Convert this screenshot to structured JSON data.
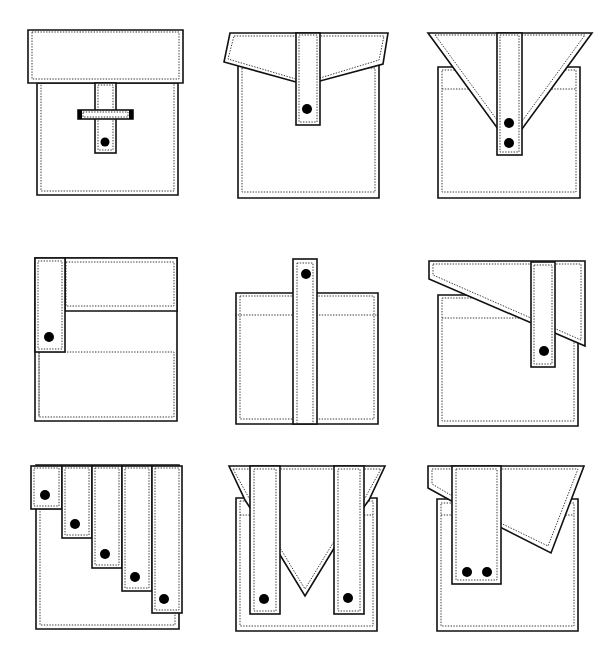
{
  "stroke_color": "#111111",
  "button_color": "#000000",
  "background": "#ffffff",
  "pockets": [
    {
      "name": "pocket-1-rect-flap-buckle",
      "body": [
        [
          37,
          83
        ],
        [
          178,
          83
        ],
        [
          178,
          195
        ],
        [
          37,
          195
        ]
      ],
      "body_stitch": [
        [
          41,
          83
        ],
        [
          174,
          83
        ],
        [
          174,
          191
        ],
        [
          41,
          191
        ]
      ],
      "flap": [
        [
          28,
          30
        ],
        [
          183,
          30
        ],
        [
          183,
          83
        ],
        [
          28,
          83
        ]
      ],
      "flap_stitch": [
        [
          32,
          32
        ],
        [
          179,
          32
        ],
        [
          179,
          79
        ],
        [
          32,
          79
        ]
      ],
      "straps": [
        {
          "rect": [
            95,
            83,
            21,
            70
          ],
          "stitch": [
            98,
            85,
            15,
            65
          ]
        }
      ],
      "buckle": {
        "rect": [
          78,
          110,
          55,
          9
        ],
        "stitch": [
          83,
          112,
          45,
          5
        ]
      },
      "buttons": [
        [
          105,
          142,
          4.5
        ]
      ],
      "extra_stitch_lines": []
    },
    {
      "name": "pocket-2-angled-flap-tab",
      "body": [
        [
          238,
          65
        ],
        [
          379,
          65
        ],
        [
          379,
          198
        ],
        [
          238,
          198
        ]
      ],
      "body_stitch": [
        [
          242,
          68
        ],
        [
          375,
          68
        ],
        [
          375,
          192
        ],
        [
          242,
          192
        ]
      ],
      "flap": [
        [
          230,
          33
        ],
        [
          388,
          33
        ],
        [
          383,
          64
        ],
        [
          320,
          81
        ],
        [
          296,
          82
        ],
        [
          224,
          62
        ]
      ],
      "flap_stitch": [
        [
          234,
          36
        ],
        [
          384,
          36
        ],
        [
          379,
          60
        ],
        [
          320,
          78
        ],
        [
          296,
          79
        ],
        [
          228,
          59
        ]
      ],
      "straps": [
        {
          "rect": [
            296,
            33,
            24,
            92
          ],
          "stitch": [
            299,
            35,
            18,
            87
          ]
        }
      ],
      "buttons": [
        [
          307,
          109,
          5
        ]
      ],
      "extra_stitch_lines": []
    },
    {
      "name": "pocket-3-v-flap-double-button",
      "body": [
        [
          438,
          67
        ],
        [
          580,
          67
        ],
        [
          580,
          198
        ],
        [
          438,
          198
        ]
      ],
      "body_stitch": [
        [
          442,
          70
        ],
        [
          576,
          70
        ],
        [
          576,
          192
        ],
        [
          442,
          192
        ]
      ],
      "flap": [
        [
          428,
          33
        ],
        [
          592,
          33
        ],
        [
          522,
          129
        ],
        [
          498,
          129
        ]
      ],
      "flap_stitch": [
        [
          435,
          35
        ],
        [
          585,
          35
        ],
        [
          520,
          124
        ],
        [
          500,
          124
        ]
      ],
      "straps": [
        {
          "rect": [
            497,
            33,
            25,
            122
          ],
          "stitch": [
            500,
            35,
            19,
            117
          ]
        }
      ],
      "buttons": [
        [
          509,
          123,
          5
        ],
        [
          509,
          143,
          5
        ]
      ],
      "extra_stitch_lines": [
        [
          [
            442,
            89
          ],
          [
            474,
            89
          ]
        ],
        [
          [
            546,
            89
          ],
          [
            576,
            89
          ]
        ]
      ]
    },
    {
      "name": "pocket-4-side-tab-upper-panel",
      "body": [
        [
          35,
          258
        ],
        [
          177,
          258
        ],
        [
          177,
          421
        ],
        [
          35,
          421
        ]
      ],
      "body_stitch": [
        [
          39,
          352
        ],
        [
          174,
          352
        ],
        [
          174,
          417
        ],
        [
          39,
          417
        ]
      ],
      "flap": [
        [
          65,
          258
        ],
        [
          177,
          258
        ],
        [
          177,
          311
        ],
        [
          65,
          311
        ]
      ],
      "flap_stitch": [
        [
          66,
          262
        ],
        [
          174,
          262
        ],
        [
          174,
          306
        ],
        [
          66,
          306
        ]
      ],
      "straps": [
        {
          "rect": [
            35,
            258,
            30,
            94
          ],
          "stitch": [
            38,
            261,
            24,
            88
          ]
        }
      ],
      "buttons": [
        [
          49,
          337,
          5
        ]
      ],
      "extra_stitch_lines": [
        [
          [
            39,
            352
          ],
          [
            39,
            417
          ]
        ]
      ]
    },
    {
      "name": "pocket-5-long-center-strap",
      "body": [
        [
          236,
          293
        ],
        [
          378,
          293
        ],
        [
          378,
          424
        ],
        [
          236,
          424
        ]
      ],
      "body_stitch": [
        [
          240,
          296
        ],
        [
          374,
          296
        ],
        [
          374,
          419
        ],
        [
          240,
          419
        ]
      ],
      "flap": null,
      "flap_stitch": null,
      "straps": [
        {
          "rect": [
            293,
            259,
            24,
            165
          ],
          "stitch": [
            297,
            263,
            16,
            161
          ]
        }
      ],
      "buttons": [
        [
          306,
          274,
          5
        ]
      ],
      "extra_stitch_lines": [
        [
          [
            235,
            315
          ],
          [
            378,
            315
          ]
        ]
      ]
    },
    {
      "name": "pocket-6-asymmetric-slant-flap",
      "body": [
        [
          438,
          295
        ],
        [
          578,
          295
        ],
        [
          578,
          426
        ],
        [
          438,
          426
        ]
      ],
      "body_stitch": [
        [
          442,
          298
        ],
        [
          574,
          298
        ],
        [
          574,
          421
        ],
        [
          442,
          421
        ]
      ],
      "flap": [
        [
          429,
          261
        ],
        [
          585,
          261
        ],
        [
          585,
          346
        ],
        [
          429,
          279
        ]
      ],
      "flap_stitch": [
        [
          433,
          264
        ],
        [
          581,
          264
        ],
        [
          581,
          340
        ],
        [
          433,
          275
        ]
      ],
      "straps": [
        {
          "rect": [
            531,
            262,
            24,
            105
          ],
          "stitch": [
            534,
            265,
            18,
            99
          ]
        }
      ],
      "buttons": [
        [
          544,
          351,
          5
        ]
      ],
      "extra_stitch_lines": [
        [
          [
            442,
            318
          ],
          [
            531,
            318
          ]
        ]
      ]
    },
    {
      "name": "pocket-7-stepped-five-tabs",
      "body": [
        [
          36,
          465
        ],
        [
          179,
          465
        ],
        [
          179,
          629
        ],
        [
          36,
          629
        ]
      ],
      "body_stitch": [
        [
          40,
          509
        ],
        [
          175,
          509
        ],
        [
          175,
          625
        ],
        [
          40,
          625
        ]
      ],
      "flap": null,
      "flap_stitch": null,
      "straps": [
        {
          "rect": [
            31,
            466,
            31,
            43
          ],
          "stitch": [
            34,
            468,
            25,
            38
          ]
        },
        {
          "rect": [
            62,
            466,
            30,
            72
          ],
          "stitch": [
            65,
            468,
            24,
            67
          ]
        },
        {
          "rect": [
            92,
            466,
            30,
            102
          ],
          "stitch": [
            95,
            468,
            24,
            97
          ]
        },
        {
          "rect": [
            122,
            466,
            30,
            125
          ],
          "stitch": [
            125,
            468,
            24,
            120
          ]
        },
        {
          "rect": [
            152,
            466,
            30,
            147
          ],
          "stitch": [
            155,
            468,
            24,
            142
          ]
        }
      ],
      "buttons": [
        [
          45,
          495,
          5
        ],
        [
          75,
          524,
          5
        ],
        [
          105,
          554,
          5
        ],
        [
          135,
          577,
          5
        ],
        [
          164,
          599,
          5
        ]
      ],
      "extra_stitch_lines": []
    },
    {
      "name": "pocket-8-double-strap-v-center",
      "body": [
        [
          236,
          498
        ],
        [
          377,
          498
        ],
        [
          377,
          631
        ],
        [
          236,
          631
        ]
      ],
      "body_stitch": [
        [
          240,
          501
        ],
        [
          373,
          501
        ],
        [
          373,
          626
        ],
        [
          240,
          626
        ]
      ],
      "flap": [
        [
          229,
          466
        ],
        [
          385,
          466
        ],
        [
          369,
          500
        ],
        [
          336,
          545
        ],
        [
          305,
          596
        ],
        [
          274,
          545
        ],
        [
          245,
          500
        ]
      ],
      "flap_stitch": [
        [
          233,
          469
        ],
        [
          381,
          469
        ],
        [
          365,
          498
        ],
        [
          333,
          543
        ],
        [
          305,
          589
        ],
        [
          277,
          543
        ],
        [
          249,
          498
        ]
      ],
      "straps": [
        {
          "rect": [
            250,
            466,
            30,
            148
          ],
          "stitch": [
            254,
            469,
            22,
            142
          ]
        },
        {
          "rect": [
            334,
            466,
            30,
            148
          ],
          "stitch": [
            338,
            469,
            22,
            142
          ]
        }
      ],
      "buttons": [
        [
          264,
          599,
          5
        ],
        [
          348,
          598,
          5
        ]
      ],
      "extra_stitch_lines": [
        [
          [
            240,
            515
          ],
          [
            250,
            515
          ]
        ],
        [
          [
            364,
            515
          ],
          [
            373,
            515
          ]
        ]
      ]
    },
    {
      "name": "pocket-9-wide-tab-asymmetric-flap",
      "body": [
        [
          437,
          499
        ],
        [
          578,
          499
        ],
        [
          578,
          631
        ],
        [
          437,
          631
        ]
      ],
      "body_stitch": [
        [
          441,
          503
        ],
        [
          574,
          503
        ],
        [
          574,
          626
        ],
        [
          441,
          626
        ]
      ],
      "flap": [
        [
          428,
          466
        ],
        [
          584,
          466
        ],
        [
          551,
          553
        ],
        [
          486,
          520
        ],
        [
          428,
          488
        ]
      ],
      "flap_stitch": [
        [
          432,
          469
        ],
        [
          578,
          469
        ],
        [
          548,
          546
        ],
        [
          486,
          516
        ],
        [
          432,
          484
        ]
      ],
      "straps": [
        {
          "rect": [
            452,
            466,
            49,
            118
          ],
          "stitch": [
            456,
            469,
            41,
            111
          ]
        }
      ],
      "buttons": [
        [
          467,
          572,
          5
        ],
        [
          487,
          572,
          5
        ]
      ],
      "extra_stitch_lines": [
        [
          [
            441,
            515
          ],
          [
            452,
            515
          ]
        ],
        [
          [
            501,
            515
          ],
          [
            574,
            515
          ]
        ]
      ]
    }
  ]
}
